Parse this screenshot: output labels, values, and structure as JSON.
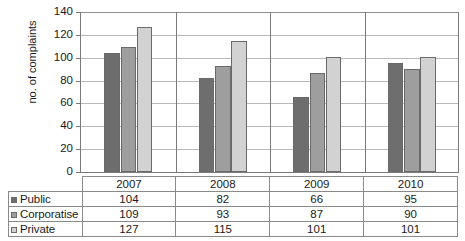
{
  "chart_data": {
    "type": "bar",
    "title": "",
    "xlabel": "",
    "ylabel": "no. of complaints",
    "categories": [
      "2007",
      "2008",
      "2009",
      "2010"
    ],
    "series": [
      {
        "name": "Public",
        "values": [
          104,
          82,
          66,
          95
        ],
        "color": "#6e6e6e"
      },
      {
        "name": "Corporatise",
        "values": [
          109,
          93,
          87,
          90
        ],
        "color": "#9e9e9e"
      },
      {
        "name": "Private",
        "values": [
          127,
          115,
          101,
          101
        ],
        "color": "#d2d2d2"
      }
    ],
    "ylim": [
      0,
      140
    ],
    "yticks": [
      0,
      20,
      40,
      60,
      80,
      100,
      120,
      140
    ],
    "ytick_labels": [
      "0",
      "20",
      "40",
      "60",
      "80",
      "100",
      "120",
      "140"
    ],
    "grid": true,
    "legend_position": "data-table-left"
  },
  "data_table": {
    "corner_label": "",
    "column_headers": [
      "2007",
      "2008",
      "2009",
      "2010"
    ],
    "rows": [
      {
        "label": "Public",
        "swatch": "#6e6e6e",
        "cells": [
          "104",
          "82",
          "66",
          "95"
        ]
      },
      {
        "label": "Corporatise",
        "swatch": "#9e9e9e",
        "cells": [
          "109",
          "93",
          "87",
          "90"
        ]
      },
      {
        "label": "Private",
        "swatch": "#d2d2d2",
        "cells": [
          "127",
          "115",
          "101",
          "101"
        ]
      }
    ]
  },
  "axis": {
    "y_title": "no. of complaints"
  }
}
